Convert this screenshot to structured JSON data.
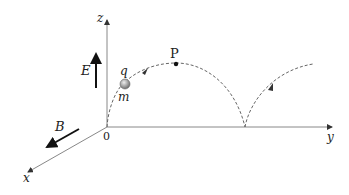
{
  "diagram": {
    "axes": {
      "x": "x",
      "y": "y",
      "z": "z",
      "origin": "0"
    },
    "fields": {
      "electric": "E",
      "magnetic": "B"
    },
    "particle": {
      "charge": "q",
      "mass": "m"
    },
    "points": {
      "top": "P"
    },
    "trajectory": "cycloid (dashed)",
    "colors": {
      "axis": "#888888",
      "ink": "#111111",
      "path": "#666666",
      "particle": "#999999"
    }
  }
}
